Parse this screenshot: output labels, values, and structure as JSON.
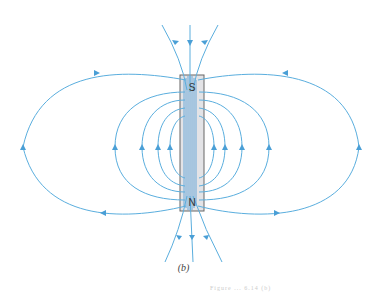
{
  "figure": {
    "caption": "(b)",
    "footer_fragment": "Figure ... 6.14 (b)",
    "colors": {
      "field_line": "#5aaede",
      "magnet_fill": "#e3e3e6",
      "magnet_border": "#666666",
      "inner_lines": "#6aa8d8"
    },
    "magnet": {
      "top_pole_label": "S",
      "bottom_pole_label": "N",
      "x": 180,
      "y": 75,
      "width": 24,
      "height": 136
    },
    "field_lines": {
      "outer_loops_count": 2,
      "inner_loops_per_side": 4,
      "axial_lines_top": 3,
      "axial_lines_bottom": 3
    }
  }
}
